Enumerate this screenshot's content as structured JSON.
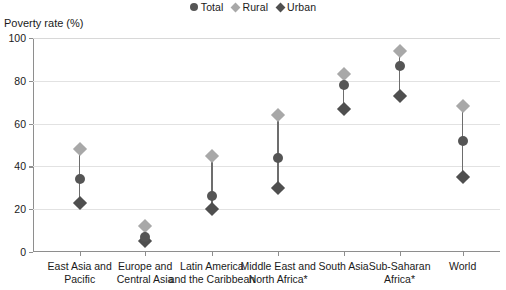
{
  "chart_data": {
    "type": "scatter",
    "title": "",
    "ylabel": "Poverty rate (%)",
    "xlabel": "",
    "ylim": [
      0,
      100
    ],
    "yticks": [
      0,
      20,
      40,
      60,
      80,
      100
    ],
    "grid": true,
    "legend_position": "top-center",
    "categories": [
      "East Asia and Pacific",
      "Europe and Central Asia",
      "Latin America and the Caribbean",
      "Middle East and North Africa*",
      "Sub-Saharan Africa*",
      "South Asia",
      "World"
    ],
    "category_lines": [
      [
        "East Asia and",
        "Pacific"
      ],
      [
        "Europe and",
        "Central Asia"
      ],
      [
        "Latin America",
        "and the Caribbean"
      ],
      [
        "Middle East and",
        "North Africa*"
      ],
      [
        "South Asia",
        ""
      ],
      [
        "Sub-Saharan",
        "Africa*"
      ],
      [
        "World",
        ""
      ]
    ],
    "series": [
      {
        "name": "Total",
        "marker": "circle",
        "color": "#555555",
        "values": [
          34,
          7,
          26,
          44,
          78,
          87,
          52
        ]
      },
      {
        "name": "Rural",
        "marker": "diamond",
        "color": "#a8a8a8",
        "values": [
          48,
          12,
          45,
          64,
          83,
          94,
          68
        ]
      },
      {
        "name": "Urban",
        "marker": "diamond",
        "color": "#4f4f4f",
        "values": [
          23,
          5,
          20,
          30,
          67,
          73,
          35
        ]
      }
    ],
    "x_positions_pct": [
      10.0,
      24.0,
      38.3,
      52.5,
      66.5,
      78.5,
      92.0
    ],
    "colors": {
      "axis": "#8e8e8e",
      "grid": "#e2e2e2",
      "connector": "#6d6d6d",
      "text": "#1a1a1a",
      "background": "#ffffff"
    }
  }
}
